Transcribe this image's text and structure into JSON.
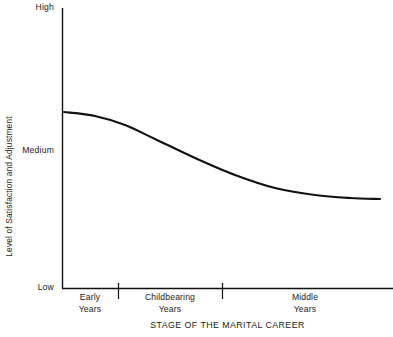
{
  "chart_data": {
    "type": "line",
    "title": "",
    "xlabel": "STAGE OF THE MARITAL CAREER",
    "ylabel": "Level of Satisfaction and Adjustment",
    "y_tick_labels": [
      "High",
      "Medium",
      "Low"
    ],
    "ylim": [
      "Low",
      "High"
    ],
    "grid": false,
    "legend": "none",
    "x_categories": [
      {
        "line1": "Early",
        "line2": "Years"
      },
      {
        "line1": "Childbearing",
        "line2": "Years"
      },
      {
        "line1": "Middle",
        "line2": "Years"
      }
    ],
    "x_category_boundaries": [
      118,
      222
    ],
    "series": [
      {
        "name": "Marital satisfaction",
        "color": "#111111",
        "description": "Satisfaction declines in an S-shaped curve from just above Medium in the Early Years to a level below Medium that levels off during the Middle Years.",
        "points": [
          {
            "x": 64,
            "y": 112
          },
          {
            "x": 95,
            "y": 116
          },
          {
            "x": 125,
            "y": 125
          },
          {
            "x": 155,
            "y": 139
          },
          {
            "x": 195,
            "y": 158
          },
          {
            "x": 235,
            "y": 175
          },
          {
            "x": 275,
            "y": 188
          },
          {
            "x": 315,
            "y": 195
          },
          {
            "x": 350,
            "y": 198
          },
          {
            "x": 380,
            "y": 199
          }
        ]
      }
    ],
    "axis_geometry": {
      "x_axis_y": 288,
      "y_axis_x": 62,
      "y_axis_top": 8,
      "x_axis_right": 393,
      "high_y": 8,
      "medium_y": 152,
      "low_y": 288
    },
    "colors": {
      "axis": "#111111",
      "curve": "#111111",
      "background": "#ffffff",
      "text": "#1a1a1a"
    }
  }
}
